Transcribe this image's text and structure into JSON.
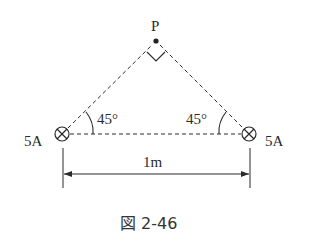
{
  "figure": {
    "caption": "図 2-46",
    "point_label": "P",
    "left_current": "5A",
    "right_current": "5A",
    "left_angle": "45°",
    "right_angle": "45°",
    "distance_label": "1m",
    "left_wire_symbol": "current-into-page",
    "right_wire_symbol": "current-into-page",
    "right_angle_marker_at": "P"
  },
  "colors": {
    "line": "#2a2a2a",
    "background": "#ffffff"
  }
}
